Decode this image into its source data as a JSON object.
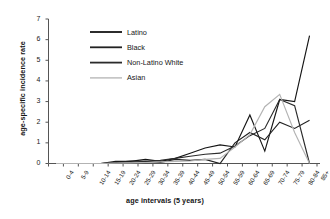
{
  "chart_data": {
    "type": "line",
    "title": "",
    "xlabel": "age intervals (5 years)",
    "ylabel": "age-specific incidence rate",
    "grid": false,
    "legend_position": "upper-left-inside",
    "ylim": [
      0,
      7
    ],
    "yticks": [
      0,
      1,
      2,
      3,
      4,
      5,
      6,
      7
    ],
    "categories": [
      "0-4",
      "5-9",
      "10-14",
      "15-19",
      "20-24",
      "25-29",
      "30-34",
      "35-39",
      "40-44",
      "45-49",
      "50-54",
      "55-59",
      "60-64",
      "65-69",
      "70-74",
      "75-79",
      "80-84",
      "85+"
    ],
    "series": [
      {
        "name": "Latino",
        "color": "#151515",
        "values": [
          0,
          0,
          0,
          0,
          0.1,
          0.1,
          0.2,
          0.1,
          0.25,
          0.5,
          0.75,
          0.9,
          0.8,
          2.35,
          0.6,
          3.1,
          3.0,
          6.2
        ]
      },
      {
        "name": "Black",
        "color": "#222222",
        "values": [
          0,
          0,
          0,
          0,
          0.05,
          0.12,
          0.1,
          0.05,
          0.2,
          0.15,
          0.2,
          0.0,
          1.0,
          1.5,
          1.15,
          2.0,
          1.7,
          2.1
        ]
      },
      {
        "name": "Non-Latino White",
        "color": "#2b2b2b",
        "values": [
          0,
          0,
          0,
          0,
          0.02,
          0.05,
          0.1,
          0.15,
          0.25,
          0.35,
          0.45,
          0.5,
          0.85,
          1.35,
          1.7,
          3.1,
          2.8,
          0.0
        ]
      },
      {
        "name": "Asian",
        "color": "#b3b3b3",
        "values": [
          0,
          0,
          0,
          0,
          0.02,
          0.03,
          0.05,
          0.08,
          0.1,
          0.12,
          0.2,
          0.25,
          0.8,
          1.4,
          2.75,
          3.35,
          1.5,
          0.0
        ]
      }
    ]
  },
  "legend": {
    "items": [
      {
        "label": "Latino"
      },
      {
        "label": "Black"
      },
      {
        "label": "Non-Latino White"
      },
      {
        "label": "Asian"
      }
    ]
  }
}
